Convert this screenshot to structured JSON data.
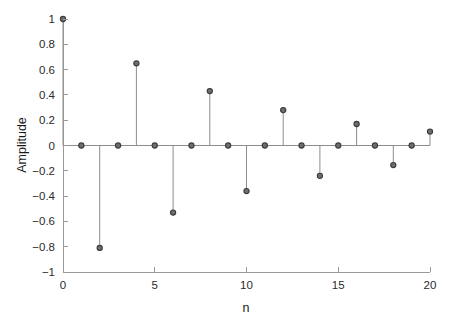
{
  "chart_data": {
    "type": "scatter",
    "plot_style": "stem",
    "title": "",
    "subtitle": "",
    "xlabel": "n",
    "ylabel": "Amplitude",
    "x": [
      0,
      1,
      2,
      3,
      4,
      5,
      6,
      7,
      8,
      9,
      10,
      11,
      12,
      13,
      14,
      15,
      16,
      17,
      18,
      19,
      20
    ],
    "values": [
      1.0,
      0.0,
      -0.81,
      0.0,
      0.65,
      0.0,
      -0.53,
      0.0,
      0.43,
      0.0,
      -0.36,
      0.0,
      0.28,
      0.0,
      -0.24,
      0.0,
      0.17,
      0.0,
      -0.155,
      0.0,
      0.11
    ],
    "series": [
      {
        "name": "Amplitude",
        "values": [
          1.0,
          0.0,
          -0.81,
          0.0,
          0.65,
          0.0,
          -0.53,
          0.0,
          0.43,
          0.0,
          -0.36,
          0.0,
          0.28,
          0.0,
          -0.24,
          0.0,
          0.17,
          0.0,
          -0.155,
          0.0,
          0.11
        ]
      }
    ],
    "xlim": [
      0,
      20
    ],
    "ylim": [
      -1,
      1
    ],
    "xticks": [
      0,
      5,
      10,
      15,
      20
    ],
    "xtick_labels": [
      "0",
      "5",
      "10",
      "15",
      "20"
    ],
    "yticks": [
      -1,
      -0.8,
      -0.6,
      -0.4,
      -0.2,
      0,
      0.2,
      0.4,
      0.6,
      0.8,
      1
    ],
    "ytick_labels": [
      "−1",
      "−0.8",
      "−0.6",
      "−0.4",
      "−0.2",
      "0",
      "0.2",
      "0.4",
      "0.6",
      "0.8",
      "1"
    ],
    "grid": false,
    "legend": false,
    "legend_position": "none",
    "colors": {
      "background": "#ffffff",
      "axis": "#9a9a9a",
      "stem_line": "#8d8d8d",
      "marker_fill": "#6e6e6e",
      "marker_edge": "#3b3b3b",
      "text": "#1a1a1a"
    }
  }
}
